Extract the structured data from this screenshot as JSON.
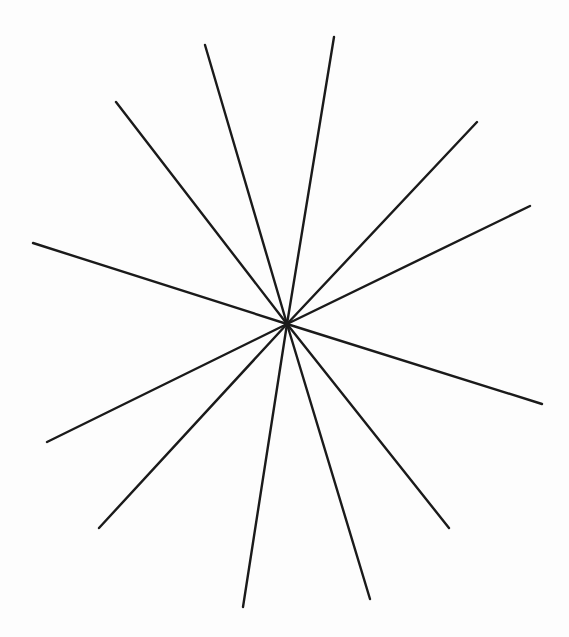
{
  "figure": {
    "type": "star-of-lines",
    "center": [
      287,
      324
    ],
    "line_color": "#1a1a1a",
    "line_count": 12,
    "endpoints": [
      [
        205,
        45
      ],
      [
        334,
        37
      ],
      [
        116,
        102
      ],
      [
        477,
        122
      ],
      [
        530,
        206
      ],
      [
        33,
        243
      ],
      [
        542,
        404
      ],
      [
        47,
        442
      ],
      [
        99,
        528
      ],
      [
        449,
        528
      ],
      [
        243,
        607
      ],
      [
        370,
        599
      ]
    ]
  },
  "background": {
    "color": "#fdfdfd",
    "bleed_through_text_color": "#e6e6e6"
  }
}
